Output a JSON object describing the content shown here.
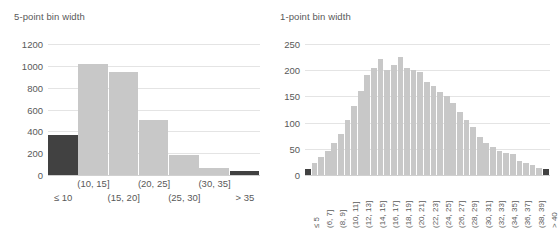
{
  "figure": {
    "background": "#ffffff",
    "bar_color": "#c8c8c8",
    "bar_color_highlight": "#414141",
    "grid_color": "#e4e4e4",
    "text_color": "#595959"
  },
  "panels": [
    {
      "id": "left",
      "title": "5-point bin width"
    },
    {
      "id": "right",
      "title": "1-point bin width"
    }
  ],
  "chart_data": [
    {
      "type": "bar",
      "title": "5-point bin width",
      "xlabel": "",
      "ylabel": "",
      "ylim": [
        0,
        1200
      ],
      "yticks": [
        0,
        200,
        400,
        600,
        800,
        1000,
        1200
      ],
      "ytick_labels": [
        "0",
        "200",
        "400",
        "600",
        "800",
        "1000",
        "1200"
      ],
      "grid": "horizontal",
      "legend": "none",
      "categories": [
        "≤ 10",
        "(10, 15]",
        "(15, 20]",
        "(20, 25]",
        "(25, 30]",
        "(30, 35]",
        "> 35"
      ],
      "values": [
        365,
        1020,
        945,
        500,
        180,
        62,
        35
      ],
      "bar_colors": [
        "#414141",
        "#c8c8c8",
        "#c8c8c8",
        "#c8c8c8",
        "#c8c8c8",
        "#c8c8c8",
        "#414141"
      ],
      "xtick_rows": [
        {
          "row": 0,
          "labels": [
            "(10, 15]",
            "(20, 25]",
            "(30, 35]"
          ],
          "indices": [
            1,
            3,
            5
          ]
        },
        {
          "row": 1,
          "labels": [
            "≤ 10",
            "(15, 20]",
            "(25, 30]",
            "> 35"
          ],
          "indices": [
            0,
            2,
            4,
            6
          ]
        }
      ]
    },
    {
      "type": "bar",
      "title": "1-point bin width",
      "xlabel": "",
      "ylabel": "",
      "ylim": [
        0,
        250
      ],
      "yticks": [
        0,
        50,
        100,
        150,
        200,
        250
      ],
      "ytick_labels": [
        "0",
        "50",
        "100",
        "150",
        "200",
        "250"
      ],
      "grid": "horizontal",
      "legend": "none",
      "categories": [
        "≤ 5",
        "(5, 6]",
        "(6, 7]",
        "(7, 8]",
        "(8, 9]",
        "(9, 10]",
        "(10, 11]",
        "(11, 12]",
        "(12, 13]",
        "(13, 14]",
        "(14, 15]",
        "(15, 16]",
        "(16, 17]",
        "(17, 18]",
        "(18, 19]",
        "(19, 20]",
        "(20, 21]",
        "(21, 22]",
        "(22, 23]",
        "(23, 24]",
        "(24, 25]",
        "(25, 26]",
        "(26, 27]",
        "(27, 28]",
        "(28, 29]",
        "(29, 30]",
        "(30, 31]",
        "(31, 32]",
        "(32, 33]",
        "(33, 34]",
        "(34, 35]",
        "(35, 36]",
        "(36, 37]",
        "(37, 38]",
        "(38, 39]",
        "(39, 40]",
        "> 40"
      ],
      "values": [
        12,
        22,
        34,
        46,
        62,
        78,
        105,
        132,
        160,
        190,
        205,
        222,
        200,
        210,
        225,
        205,
        200,
        196,
        178,
        170,
        158,
        150,
        138,
        120,
        105,
        92,
        72,
        62,
        54,
        46,
        42,
        40,
        26,
        22,
        20,
        14,
        12
      ],
      "highlight_first": true,
      "highlight_last": true,
      "xtick_labels_shown": [
        "≤ 5",
        "(6, 7]",
        "(8, 9]",
        "(10, 11]",
        "(12, 13]",
        "(14, 15]",
        "(16, 17]",
        "(18, 19]",
        "(20, 21]",
        "(22, 23]",
        "(24, 25]",
        "(26, 27]",
        "(28, 29]",
        "(30, 31]",
        "(32, 33]",
        "(34, 35]",
        "(36, 37]",
        "(38, 39]",
        "> 40"
      ],
      "xtick_label_indices": [
        0,
        2,
        4,
        6,
        8,
        10,
        12,
        14,
        16,
        18,
        20,
        22,
        24,
        26,
        28,
        30,
        32,
        34,
        36
      ]
    }
  ]
}
